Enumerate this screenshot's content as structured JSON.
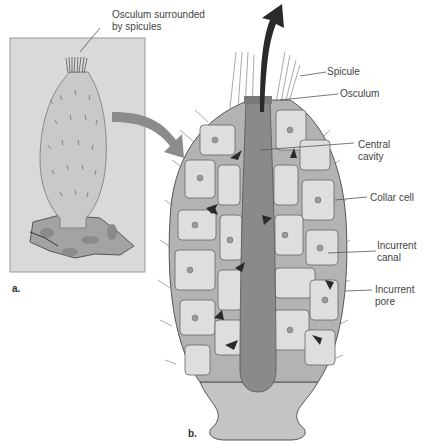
{
  "figure": {
    "panel_a": {
      "letter": "a.",
      "callout": {
        "line1": "Osculum surrounded",
        "line2": "by spicules"
      }
    },
    "panel_b": {
      "letter": "b.",
      "labels": [
        {
          "id": "spicule",
          "line1": "Spicule",
          "line2": ""
        },
        {
          "id": "osculum",
          "line1": "Osculum",
          "line2": ""
        },
        {
          "id": "central-cavity",
          "line1": "Central",
          "line2": "cavity"
        },
        {
          "id": "collar-cell",
          "line1": "Collar cell",
          "line2": ""
        },
        {
          "id": "incurrent-canal",
          "line1": "Incurrent",
          "line2": "canal"
        },
        {
          "id": "incurrent-pore",
          "line1": "Incurrent",
          "line2": "pore"
        }
      ]
    },
    "colors": {
      "panel_bg": "#d9d9d9",
      "body_light": "#cfcfcf",
      "mesohyl": "#b3b3b3",
      "chamber": "#dedede",
      "central_cavity": "#8a8a8a",
      "arrow": "#2a2a2a",
      "pointer_arrow": "#8c8c8c",
      "rock": "#a3a3a3"
    }
  }
}
